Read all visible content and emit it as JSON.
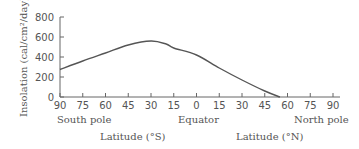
{
  "chart_data": {
    "type": "line",
    "title": "",
    "ylabel": "Insolation (cal/cm²/day)",
    "xlabel_south": "Latitude (°S)",
    "xlabel_north": "Latitude (°N)",
    "annotations": {
      "south_pole": "South pole",
      "equator": "Equator",
      "north_pole": "North pole"
    },
    "ylim": [
      0,
      800
    ],
    "yticks": [
      0,
      200,
      400,
      600,
      800
    ],
    "xticks": [
      "90",
      "75",
      "60",
      "45",
      "30",
      "15",
      "0",
      "15",
      "30",
      "45",
      "60",
      "75",
      "90"
    ],
    "x_signed_latitude": [
      -90,
      -75,
      -60,
      -45,
      -30,
      -15,
      0,
      15,
      30,
      45,
      55,
      60,
      75,
      90
    ],
    "series": [
      {
        "name": "Insolation",
        "x": [
          -90,
          -75,
          -60,
          -45,
          -30,
          -20,
          -15,
          0,
          15,
          30,
          45,
          55
        ],
        "values": [
          275,
          360,
          440,
          520,
          560,
          530,
          490,
          420,
          290,
          170,
          60,
          0
        ]
      }
    ],
    "grid": false,
    "legend": "none"
  }
}
